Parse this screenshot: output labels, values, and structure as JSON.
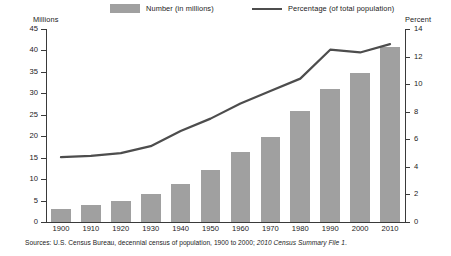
{
  "legend": {
    "bar_label": "Number (in millions)",
    "line_label": "Percentage (of total population)",
    "bar_swatch_icon": "bar-swatch-icon",
    "line_swatch_icon": "line-swatch-icon"
  },
  "axes": {
    "left_caption": "Millions",
    "right_caption": "Percent",
    "left_ticks": [
      "0",
      "5",
      "10",
      "15",
      "20",
      "25",
      "30",
      "35",
      "40",
      "45"
    ],
    "right_ticks": [
      "0",
      "2",
      "4",
      "6",
      "8",
      "10",
      "12",
      "14"
    ]
  },
  "source": {
    "plain": "Sources: U.S. Census Bureau, decennial census of population, 1900 to 2000;",
    "italic": "2010 Census Summary File 1",
    "period": "."
  },
  "colors": {
    "bar_fill": "#a0a0a0",
    "line_stroke": "#4d4d4d",
    "axis": "#3a3a3a",
    "text": "#1a1a1a",
    "background": "#ffffff"
  },
  "chart_data": {
    "type": "bar",
    "title": "",
    "subtitle": "",
    "xlabel": "",
    "ylabel": "Millions",
    "y2label": "Percent",
    "categories": [
      "1900",
      "1910",
      "1920",
      "1930",
      "1940",
      "1950",
      "1960",
      "1970",
      "1980",
      "1990",
      "2000",
      "2010"
    ],
    "ylim": [
      0,
      45
    ],
    "y2lim": [
      0,
      14
    ],
    "grid": false,
    "legend_position": "top",
    "series": [
      {
        "name": "Number (in millions)",
        "type": "bar",
        "axis": "left",
        "units": "millions",
        "values": [
          3.1,
          3.9,
          4.9,
          6.6,
          8.9,
          12.2,
          16.3,
          19.8,
          25.9,
          31.0,
          34.7,
          40.7
        ]
      },
      {
        "name": "Percentage (of total population)",
        "type": "line",
        "axis": "right",
        "units": "percent",
        "values": [
          4.7,
          4.8,
          5.0,
          5.5,
          6.6,
          7.5,
          8.6,
          9.5,
          10.4,
          12.5,
          12.3,
          12.9
        ]
      }
    ]
  }
}
